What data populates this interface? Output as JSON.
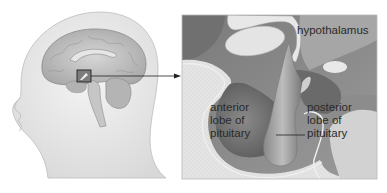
{
  "figure": {
    "type": "anatomical-diagram",
    "inset_labels": {
      "hypothalamus": "hypothalamus",
      "anterior": "anterior\nlobe of\npituitary",
      "posterior": "posterior\nlobe of\npituitary"
    },
    "colors": {
      "skin": "#ececec",
      "brain": "#c8c8c8",
      "dark_tissue": "#6e6e6e",
      "mid_tissue": "#9a9a9a",
      "light_tissue": "#e2e2e2",
      "bone": "#dcdcdc",
      "line": "#222222"
    }
  }
}
